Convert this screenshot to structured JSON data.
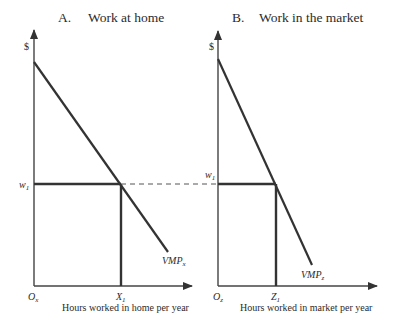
{
  "panels": [
    {
      "title_letter": "A.",
      "title_text": "Work at home",
      "y_label": "$",
      "wage_label": "w",
      "wage_sub": "1",
      "origin_label": "O",
      "origin_sub": "x",
      "quantity_label": "X",
      "quantity_sub": "1",
      "curve_label": "VMP",
      "curve_sub": "x",
      "x_axis_label": "Hours worked in home per year"
    },
    {
      "title_letter": "B.",
      "title_text": "Work in the market",
      "y_label": "$",
      "wage_label": "w",
      "wage_sub": "1",
      "origin_label": "O",
      "origin_sub": "z",
      "quantity_label": "Z",
      "quantity_sub": "1",
      "curve_label": "VMP",
      "curve_sub": "z",
      "x_axis_label": "Hours worked in market per year"
    }
  ],
  "colors": {
    "ink": "#2b2b2b",
    "line": "#333333"
  }
}
